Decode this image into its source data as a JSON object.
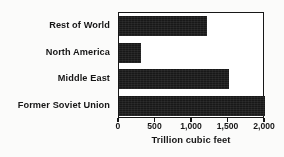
{
  "chart_data": {
    "type": "bar",
    "orientation": "horizontal",
    "title": "",
    "xlabel": "Trillion cubic feet",
    "ylabel": "",
    "categories": [
      "Rest of World",
      "North America",
      "Middle East",
      "Former Soviet Union"
    ],
    "values": [
      1200,
      300,
      1500,
      2000
    ],
    "xlim": [
      0,
      2000
    ],
    "xticks": [
      0,
      500,
      1000,
      1500,
      2000
    ],
    "xticklabels": [
      "0",
      "500",
      "1,000",
      "1,500",
      "2,000"
    ],
    "grid": false,
    "legend": false,
    "bar_color": "#1c1c1c",
    "frame_color": "#1b1b1b",
    "background_color": "#f7f6f3"
  }
}
